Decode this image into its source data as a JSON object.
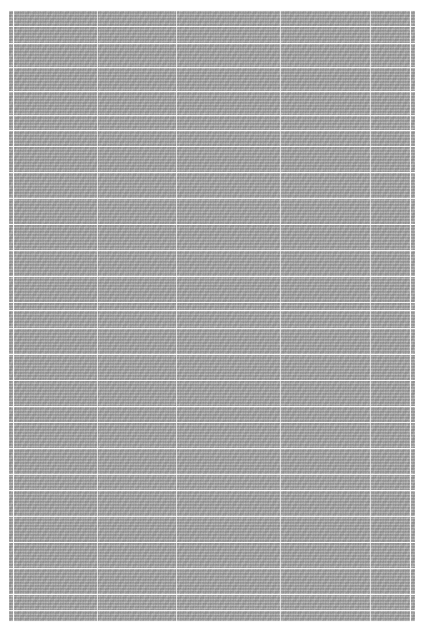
{
  "document": {
    "kind": "scanned-ruled-table-page",
    "description": "Low-resolution scan of a dense ruled ledger/table page; body text is not legible at this resolution",
    "page_background": "#ffffff",
    "content_background": "#9b9b9b",
    "rule_color": "#ffffff",
    "legible_text": "",
    "margins": {
      "left_px": 9,
      "top_px": 10,
      "right_px": 16,
      "bottom_px": 13
    },
    "content_box": {
      "x": 9,
      "y": 10,
      "width": 406,
      "height": 612
    },
    "layout": {
      "column_rule_x": [
        4,
        88,
        167,
        271,
        361,
        401
      ],
      "row_rule_y": [
        0,
        16,
        33,
        57,
        81,
        105,
        120,
        136,
        162,
        188,
        214,
        240,
        266,
        292,
        300,
        318,
        344,
        370,
        396,
        412,
        438,
        464,
        480,
        506,
        532,
        558,
        584,
        600,
        611
      ],
      "major_row_rule_y": [
        0,
        33,
        81,
        120,
        162,
        214,
        266,
        300,
        344,
        396,
        438,
        480,
        532,
        584,
        611
      ]
    }
  }
}
